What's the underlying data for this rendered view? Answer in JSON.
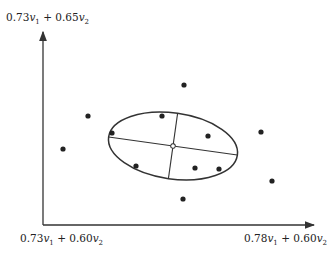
{
  "axes": {
    "y_label": {
      "coef1": "0.73",
      "var1": "v",
      "sub1": "1",
      "op": " + ",
      "coef2": "0.65",
      "var2": "v",
      "sub2": "2"
    },
    "origin_label": {
      "coef1": "0.73",
      "var1": "v",
      "sub1": "1",
      "op": " + ",
      "coef2": "0.60",
      "var2": "v",
      "sub2": "2"
    },
    "x_label": {
      "coef1": "0.78",
      "var1": "v",
      "sub1": "1",
      "op": " + ",
      "coef2": "0.60",
      "var2": "v",
      "sub2": "2"
    }
  },
  "chart_data": {
    "type": "scatter",
    "title": "",
    "xlabel": "0.78v1 + 0.60v2",
    "ylabel": "0.73v1 + 0.65v2",
    "origin_label": "0.73v1 + 0.60v2",
    "points_px": [
      [
        88,
        116
      ],
      [
        184,
        85
      ],
      [
        162,
        116
      ],
      [
        112,
        133
      ],
      [
        208,
        136
      ],
      [
        261,
        132
      ],
      [
        63,
        149
      ],
      [
        136,
        166
      ],
      [
        195,
        168
      ],
      [
        219,
        169
      ],
      [
        272,
        181
      ],
      [
        183,
        199
      ]
    ],
    "ellipse": {
      "cx": 173,
      "cy": 146,
      "rx": 65,
      "ry": 33,
      "rotation_deg": 8
    },
    "center_marker": "open-circle",
    "grid": false,
    "legend": null
  }
}
